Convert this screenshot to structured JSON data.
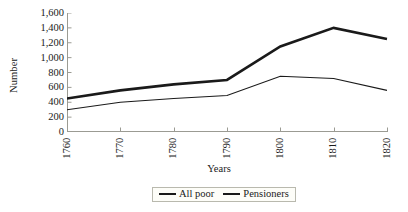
{
  "chart_data": {
    "type": "line",
    "title": "",
    "xlabel": "Years",
    "ylabel": "Number",
    "x": [
      1760,
      1770,
      1780,
      1790,
      1800,
      1810,
      1820
    ],
    "categories": [
      "1760",
      "1770",
      "1780",
      "1790",
      "1800",
      "1810",
      "1820"
    ],
    "xlim": [
      1760,
      1820
    ],
    "ylim": [
      0,
      1600
    ],
    "ytick_values": [
      0,
      200,
      400,
      600,
      800,
      1000,
      1200,
      1400,
      1600
    ],
    "ytick_labels": [
      "0",
      "200",
      "400",
      "600",
      "800",
      "1,000",
      "1,200",
      "1,400",
      "1,600"
    ],
    "grid": false,
    "legend_position": "bottom-center",
    "series": [
      {
        "name": "All poor",
        "values": [
          450,
          560,
          640,
          700,
          1150,
          1400,
          1250
        ],
        "color": "#1a1a1a",
        "line_width": 2.6,
        "style": "thick"
      },
      {
        "name": "Pensioners",
        "values": [
          300,
          400,
          450,
          490,
          750,
          720,
          560
        ],
        "color": "#1a1a1a",
        "line_width": 1.1,
        "style": "thin"
      }
    ]
  },
  "axes": {
    "y_title": "Number",
    "x_title": "Years"
  },
  "legend": {
    "entries": [
      {
        "label": "All poor"
      },
      {
        "label": "Pensioners"
      }
    ]
  },
  "colors": {
    "line": "#1a1a1a",
    "axis": "#9b9b93",
    "tick": "#9b9b93",
    "legend_border": "#b9b9ae",
    "background": "#ffffff"
  }
}
